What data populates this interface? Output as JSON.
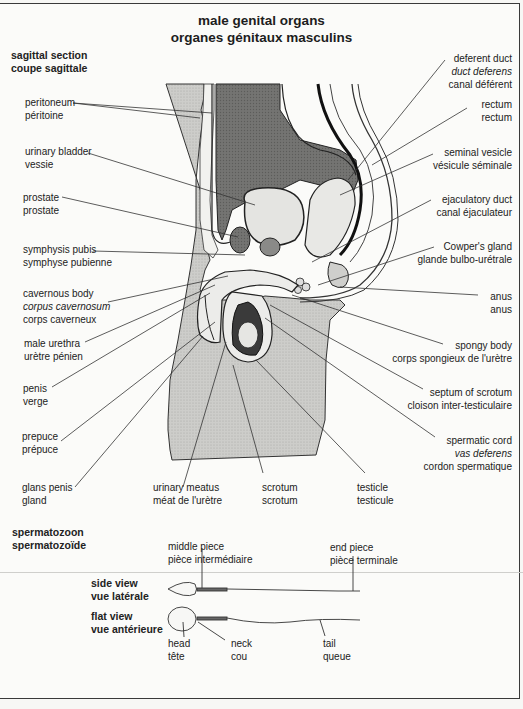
{
  "title": {
    "en": "male genital organs",
    "fr": "organes génitaux masculins"
  },
  "sagittal_section": {
    "heading": {
      "en": "sagittal section",
      "fr": "coupe sagittale"
    },
    "left_labels": [
      {
        "en": "peritoneum",
        "fr": "péritoine"
      },
      {
        "en": "urinary bladder",
        "fr": "vessie"
      },
      {
        "en": "prostate",
        "fr": "prostate"
      },
      {
        "en": "symphysis pubis",
        "fr": "symphyse pubienne"
      },
      {
        "en": "cavernous body",
        "latin": "corpus cavernosum",
        "fr": "corps caverneux"
      },
      {
        "en": "male urethra",
        "fr": "urètre pénien"
      },
      {
        "en": "penis",
        "fr": "verge"
      },
      {
        "en": "prepuce",
        "fr": "prépuce"
      },
      {
        "en": "glans penis",
        "fr": "gland"
      }
    ],
    "right_labels": [
      {
        "en": "deferent duct",
        "latin": "duct deferens",
        "fr": "canal déférent"
      },
      {
        "en": "rectum",
        "fr": "rectum"
      },
      {
        "en": "seminal vesicle",
        "fr": "vésicule séminale"
      },
      {
        "en": "ejaculatory duct",
        "fr": "canal éjaculateur"
      },
      {
        "en": "Cowper's gland",
        "fr": "glande bulbo-urétrale"
      },
      {
        "en": "anus",
        "fr": "anus"
      },
      {
        "en": "spongy body",
        "fr": "corps spongieux de l'urètre"
      },
      {
        "en": "septum of scrotum",
        "fr": "cloison inter-testiculaire"
      },
      {
        "en": "spermatic cord",
        "latin": "vas deferens",
        "fr": "cordon spermatique"
      }
    ],
    "bottom_labels": [
      {
        "en": "urinary meatus",
        "fr": "méat de l'urètre"
      },
      {
        "en": "scrotum",
        "fr": "scrotum"
      },
      {
        "en": "testicle",
        "fr": "testicule"
      }
    ]
  },
  "spermatozoon": {
    "heading": {
      "en": "spermatozoon",
      "fr": "spermatozoïde"
    },
    "views": [
      {
        "en": "side view",
        "fr": "vue latérale"
      },
      {
        "en": "flat view",
        "fr": "vue antérieure"
      }
    ],
    "top_labels": [
      {
        "en": "middle piece",
        "fr": "pièce intermédiaire"
      },
      {
        "en": "end piece",
        "fr": "pièce terminale"
      }
    ],
    "bottom_labels": [
      {
        "en": "head",
        "fr": "tête"
      },
      {
        "en": "neck",
        "fr": "cou"
      },
      {
        "en": "tail",
        "fr": "queue"
      }
    ]
  },
  "colors": {
    "skin_shade": "#c9c9c6",
    "organ_dark": "#6e6e6c",
    "organ_light": "#e2e2df",
    "line": "#2a2a2a"
  }
}
